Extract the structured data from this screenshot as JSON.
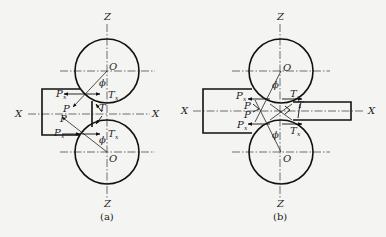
{
  "figure": {
    "panels": [
      {
        "id": "a",
        "caption": "(a)",
        "axes": {
          "x_left": "X",
          "x_right": "X",
          "z_top": "Z",
          "z_bottom": "Z"
        },
        "roll_centers": [
          "O",
          "O"
        ],
        "angle_top": "ϕ",
        "angle_bottom": "ϕ",
        "forces": {
          "Px_top": {
            "main": "P",
            "sub": "x"
          },
          "Px_bottom": {
            "main": "P",
            "sub": "x"
          },
          "P_top": "P",
          "P_bottom": "P",
          "Tx_top": {
            "main": "T",
            "sub": "x"
          },
          "Tx_bottom": {
            "main": "T",
            "sub": "x"
          },
          "T": "T"
        }
      },
      {
        "id": "b",
        "caption": "(b)",
        "axes": {
          "x_left": "X",
          "x_right": "X",
          "z_top": "Z",
          "z_bottom": "Z"
        },
        "roll_centers": [
          "O",
          "O"
        ],
        "angle_top": "ϕ",
        "angle_bottom": "ϕ",
        "forces": {
          "Px_top": {
            "main": "P",
            "sub": "x"
          },
          "Px_bottom": {
            "main": "P",
            "sub": "x"
          },
          "P_top": "P",
          "P_bottom": "P",
          "Tx_top": {
            "main": "T",
            "sub": "x"
          },
          "Tx_bottom": {
            "main": "T",
            "sub": "x"
          },
          "T": "T"
        }
      }
    ]
  }
}
